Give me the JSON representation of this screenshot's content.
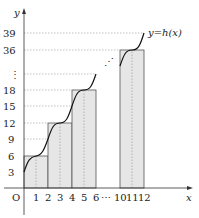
{
  "figure": {
    "curve_label": "y=h(x)",
    "x_axis_label": "x",
    "y_axis_label": "y",
    "origin_label": "O",
    "x_ticks": [
      "1",
      "2",
      "3",
      "4",
      "5",
      "6",
      "⋯",
      "10",
      "11",
      "12"
    ],
    "y_ticks": [
      "3",
      "6",
      "9",
      "12",
      "15",
      "18",
      "⋮",
      "36",
      "39"
    ],
    "ellipsis_diag": "⋰",
    "rectangles": [
      {
        "x_from": 0,
        "x_to": 2,
        "height": 6
      },
      {
        "x_from": 2,
        "x_to": 4,
        "height": 12
      },
      {
        "x_from": 4,
        "x_to": 6,
        "height": 18
      },
      {
        "x_from": 10,
        "x_to": 12,
        "height": 36
      }
    ],
    "angle_mark": "α",
    "colors": {
      "rect_fill": "#e6e6e6",
      "stroke": "#222222",
      "dash": "#888888"
    }
  }
}
